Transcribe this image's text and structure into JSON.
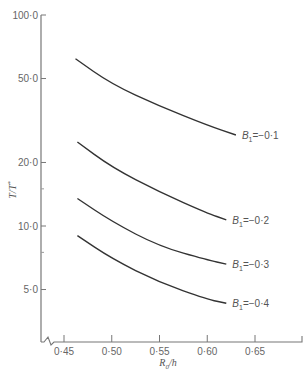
{
  "chart_data": {
    "type": "line",
    "title": "",
    "xlabel": "R0/h",
    "xlabel_parts": {
      "main": "R",
      "sub": "0",
      "rest": "/h"
    },
    "ylabel": "T/T*",
    "ylabel_parts": {
      "main": "T/T",
      "sup": "*"
    },
    "yscale": "log",
    "xlim": [
      0.43,
      0.69
    ],
    "ylim": [
      3.5,
      100.0
    ],
    "grid": false,
    "x_ticks": [
      {
        "value": 0.45,
        "label": "0·45"
      },
      {
        "value": 0.5,
        "label": "0·50"
      },
      {
        "value": 0.55,
        "label": "0·55"
      },
      {
        "value": 0.6,
        "label": "0·60"
      },
      {
        "value": 0.65,
        "label": "0·65"
      }
    ],
    "y_ticks": [
      {
        "value": 100.0,
        "label": "100·0"
      },
      {
        "value": 50.0,
        "label": "50·0"
      },
      {
        "value": 20.0,
        "label": "20·0"
      },
      {
        "value": 10.0,
        "label": "10·0"
      },
      {
        "value": 5.0,
        "label": "5·0"
      }
    ],
    "y_minor_ticks": [
      15.0,
      7.5
    ],
    "axis_break": "x-axis break near origin",
    "series": [
      {
        "name": "B1=-0·1",
        "label_main": "B",
        "label_sub": "1",
        "label_rest": "=−0·1",
        "x": [
          0.462,
          0.5,
          0.55,
          0.6,
          0.63
        ],
        "y": [
          62.0,
          47.0,
          37.0,
          30.0,
          27.0
        ]
      },
      {
        "name": "B1=-0·2",
        "label_main": "B",
        "label_sub": "1",
        "label_rest": "=−0·2",
        "x": [
          0.464,
          0.5,
          0.55,
          0.6,
          0.62
        ],
        "y": [
          25.0,
          19.0,
          14.5,
          11.5,
          10.7
        ]
      },
      {
        "name": "B1=-0·3",
        "label_main": "B",
        "label_sub": "1",
        "label_rest": "=−0·3",
        "x": [
          0.464,
          0.5,
          0.55,
          0.6,
          0.62
        ],
        "y": [
          13.5,
          10.5,
          8.0,
          6.9,
          6.6
        ]
      },
      {
        "name": "B1=-0·4",
        "label_main": "B",
        "label_sub": "1",
        "label_rest": "=−0·4",
        "x": [
          0.464,
          0.5,
          0.55,
          0.6,
          0.62
        ],
        "y": [
          9.0,
          7.0,
          5.4,
          4.5,
          4.3
        ]
      }
    ]
  },
  "colors": {
    "axis": "#777777",
    "curve": "#333333",
    "text": "#666666"
  }
}
